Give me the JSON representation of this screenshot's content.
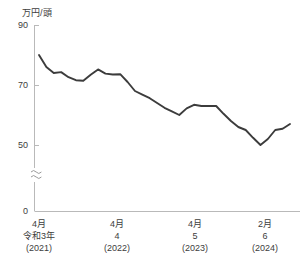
{
  "chart_data": {
    "type": "line",
    "title": "",
    "subtitle": "",
    "ylabel": "万円/頭",
    "xlabel": "",
    "ylim": [
      0,
      90
    ],
    "axis_break": true,
    "axis_break_symbol": "≈",
    "grid": false,
    "legend": null,
    "y_ticks": [
      {
        "label": "90",
        "value": 90
      },
      {
        "label": "70",
        "value": 70
      },
      {
        "label": "50",
        "value": 50
      },
      {
        "label": "0",
        "value": 0
      }
    ],
    "x_ticks": [
      {
        "month": "4月",
        "era_year": "令和3年",
        "western": "(2021)",
        "index": 0
      },
      {
        "month": "4月",
        "era_year": "4",
        "western": "(2022)",
        "index": 12
      },
      {
        "month": "4月",
        "era_year": "5",
        "western": "(2023)",
        "index": 24
      },
      {
        "month": "2月",
        "era_year": "6",
        "western": "(2024)",
        "index": 34
      }
    ],
    "x": [
      "2021-04",
      "2021-05",
      "2021-06",
      "2021-07",
      "2021-08",
      "2021-09",
      "2021-10",
      "2021-11",
      "2021-12",
      "2022-01",
      "2022-02",
      "2022-03",
      "2022-04",
      "2022-05",
      "2022-06",
      "2022-07",
      "2022-08",
      "2022-09",
      "2022-10",
      "2022-11",
      "2022-12",
      "2023-01",
      "2023-02",
      "2023-03",
      "2023-04",
      "2023-05",
      "2023-06",
      "2023-07",
      "2023-08",
      "2023-09",
      "2023-10",
      "2023-11",
      "2023-12",
      "2024-01",
      "2024-02"
    ],
    "series": [
      {
        "name": "子牛price",
        "color": "#3c3c3c",
        "values": [
          80.0,
          76.0,
          74.0,
          74.3,
          72.6,
          71.6,
          71.4,
          73.4,
          75.2,
          73.8,
          73.5,
          73.6,
          71.0,
          68.0,
          66.8,
          65.6,
          64.0,
          62.4,
          61.2,
          60.0,
          62.2,
          63.4,
          63.0,
          63.0,
          63.0,
          60.4,
          58.0,
          56.0,
          55.0,
          52.4,
          50.0,
          52.0,
          55.0,
          55.4,
          57.0
        ]
      }
    ]
  }
}
